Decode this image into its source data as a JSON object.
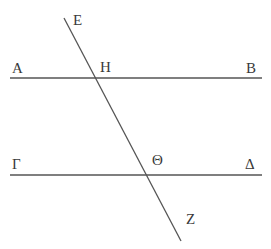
{
  "figure": {
    "background_color": "#ffffff",
    "line_color": "#555555",
    "label_color": "#3a3a3a",
    "width": 271,
    "height": 249
  },
  "labels": {
    "A": "A",
    "B": "B",
    "gamma": "Γ",
    "delta": "Δ",
    "epsilon": "E",
    "zeta": "Z",
    "eta": "H",
    "theta": "Θ"
  },
  "chart_data": {
    "type": "diagram",
    "points": [
      {
        "name": "A",
        "label": "A",
        "x": 18,
        "y": 78,
        "role": "left-endpoint-top-line"
      },
      {
        "name": "B",
        "label": "B",
        "x": 256,
        "y": 78,
        "role": "right-endpoint-top-line"
      },
      {
        "name": "G",
        "label": "Γ",
        "x": 18,
        "y": 175,
        "role": "left-endpoint-bottom-line"
      },
      {
        "name": "D",
        "label": "Δ",
        "x": 256,
        "y": 175,
        "role": "right-endpoint-bottom-line"
      },
      {
        "name": "E",
        "label": "E",
        "x": 64,
        "y": 22,
        "role": "top-endpoint-transversal"
      },
      {
        "name": "Z",
        "label": "Z",
        "x": 181,
        "y": 240,
        "role": "bottom-endpoint-transversal"
      },
      {
        "name": "H",
        "label": "H",
        "x": 97,
        "y": 78,
        "role": "intersection-top"
      },
      {
        "name": "TH",
        "label": "Θ",
        "x": 148,
        "y": 175,
        "role": "intersection-bottom"
      }
    ],
    "segments": [
      {
        "name": "line-AB",
        "from": "A",
        "to": "B",
        "x1": 10,
        "y1": 78,
        "x2": 262,
        "y2": 78,
        "kind": "parallel-line"
      },
      {
        "name": "line-GD",
        "from": "G",
        "to": "D",
        "x1": 10,
        "y1": 175,
        "x2": 262,
        "y2": 175,
        "kind": "parallel-line"
      },
      {
        "name": "line-EZ",
        "from": "E",
        "to": "Z",
        "x1": 64,
        "y1": 18,
        "x2": 181,
        "y2": 241,
        "kind": "transversal"
      }
    ],
    "relations": [
      "line AB is parallel to line ΓΔ",
      "line EZ is a transversal crossing AB at H and ΓΔ at Θ"
    ]
  }
}
